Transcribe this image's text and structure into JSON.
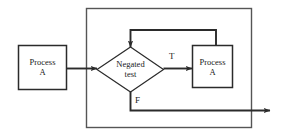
{
  "diagram": {
    "type": "flowchart",
    "background_color": "#ffffff",
    "stroke_color": "#2b2b2b",
    "text_color": "#1a1a1a",
    "nodes": [
      {
        "id": "process-a-left",
        "shape": "rectangle",
        "label": "Process\nA",
        "x": 18,
        "y": 45,
        "width": 49,
        "height": 45
      },
      {
        "id": "negated-test",
        "shape": "diamond",
        "label": "Negated\ntest",
        "x": 97,
        "y": 47,
        "width": 66,
        "height": 45
      },
      {
        "id": "process-a-right",
        "shape": "rectangle",
        "label": "Process\nA",
        "x": 192,
        "y": 45,
        "width": 41,
        "height": 43
      }
    ],
    "group_box": {
      "id": "loop-boundary",
      "x": 86,
      "y": 8,
      "width": 166,
      "height": 120
    },
    "edges": [
      {
        "id": "entry-edge",
        "from": "process-a-left",
        "to": "negated-test",
        "label": ""
      },
      {
        "id": "true-edge",
        "from": "negated-test",
        "to": "process-a-right",
        "label": "T"
      },
      {
        "id": "false-edge",
        "from": "negated-test",
        "to": "exit",
        "label": "F"
      },
      {
        "id": "loop-back-edge",
        "from": "process-a-right",
        "to": "negated-test",
        "label": ""
      }
    ]
  }
}
